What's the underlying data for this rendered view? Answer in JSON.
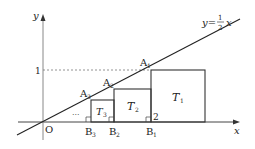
{
  "diagram": {
    "axes": {
      "x_label": "x",
      "y_label": "y",
      "origin_label": "O",
      "y_tick_label": "1",
      "x_tick_label": "2"
    },
    "line": {
      "equation_lhs": "y=",
      "fraction_num": "1",
      "fraction_den": "2",
      "equation_var": "x"
    },
    "points": {
      "A1": {
        "letter": "A",
        "sub": "1"
      },
      "A2": {
        "letter": "A",
        "sub": "2"
      },
      "A3": {
        "letter": "A",
        "sub": "3"
      },
      "B1": {
        "letter": "B",
        "sub": "1"
      },
      "B2": {
        "letter": "B",
        "sub": "2"
      },
      "B3": {
        "letter": "B",
        "sub": "3"
      }
    },
    "squares": {
      "T1": {
        "letter": "T",
        "sub": "1"
      },
      "T2": {
        "letter": "T",
        "sub": "2"
      },
      "T3": {
        "letter": "T",
        "sub": "3"
      }
    },
    "ellipsis": "···",
    "colors": {
      "stroke": "#222222",
      "axis": "#555555",
      "dashed": "#777777"
    }
  }
}
